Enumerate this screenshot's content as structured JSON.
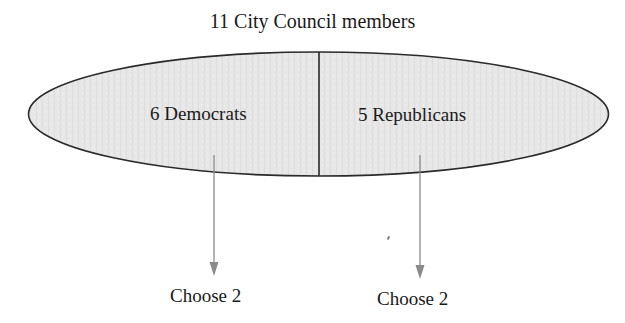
{
  "title": "11 City Council members",
  "groups": [
    {
      "label": "6 Democrats",
      "action": "Choose 2"
    },
    {
      "label": "5 Republicans",
      "action": "Choose 2"
    }
  ],
  "colors": {
    "ellipse_fill": "#e6e6e6",
    "outline": "#2a2a2a",
    "arrow": "#8a8a8a",
    "text": "#1a1a1a"
  }
}
